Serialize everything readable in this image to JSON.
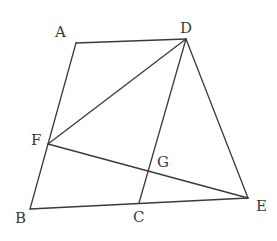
{
  "figure": {
    "stroke_color": "#3a3a3a",
    "label_color": "#3a3a3a",
    "background": "#ffffff"
  },
  "points": {
    "A": {
      "label": "A",
      "x": 76,
      "y": 43,
      "label_x": 55,
      "label_y": 25
    },
    "D": {
      "label": "D",
      "x": 186,
      "y": 39,
      "label_x": 180,
      "label_y": 21
    },
    "F": {
      "label": "F",
      "x": 48,
      "y": 144,
      "label_x": 31,
      "label_y": 133
    },
    "B": {
      "label": "B",
      "x": 30,
      "y": 209,
      "label_x": 15,
      "label_y": 211
    },
    "C": {
      "label": "C",
      "x": 139,
      "y": 203,
      "label_x": 133,
      "label_y": 210
    },
    "G": {
      "label": "G",
      "x": 147,
      "y": 168,
      "label_x": 157,
      "label_y": 155
    },
    "E": {
      "label": "E",
      "x": 248,
      "y": 198,
      "label_x": 256,
      "label_y": 199
    }
  },
  "segments": [
    {
      "from": "A",
      "to": "D"
    },
    {
      "from": "A",
      "to": "B"
    },
    {
      "from": "B",
      "to": "E"
    },
    {
      "from": "D",
      "to": "E"
    },
    {
      "from": "D",
      "to": "F"
    },
    {
      "from": "D",
      "to": "C"
    },
    {
      "from": "F",
      "to": "E"
    }
  ]
}
